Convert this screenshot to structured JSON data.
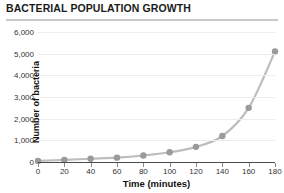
{
  "header": {
    "title": "BACTERIAL POPULATION GROWTH"
  },
  "chart_data": {
    "type": "line",
    "title": "BACTERIAL POPULATION GROWTH",
    "xlabel": "Time (minutes)",
    "ylabel": "Number of bacteria",
    "x": [
      0,
      20,
      40,
      60,
      80,
      100,
      120,
      140,
      160,
      180
    ],
    "values": [
      50,
      100,
      150,
      200,
      300,
      450,
      700,
      1200,
      2500,
      5100
    ],
    "xlim": [
      0,
      180
    ],
    "ylim": [
      0,
      6000
    ],
    "xticks": [
      0,
      20,
      40,
      60,
      80,
      100,
      120,
      140,
      160,
      180
    ],
    "xtick_labels": [
      "0",
      "20",
      "40",
      "60",
      "80",
      "100",
      "120",
      "140",
      "160",
      "180"
    ],
    "yticks": [
      0,
      1000,
      2000,
      3000,
      4000,
      5000,
      6000
    ],
    "ytick_labels": [
      "0",
      "1,000",
      "2,000",
      "3,000",
      "4,000",
      "5,000",
      "6,000"
    ],
    "grid": true,
    "legend": false,
    "marker": "circle",
    "series_color": "#9a9a9a",
    "line_color": "#bdbdbd",
    "grid_color": "#ececec",
    "axis_color": "#4a4a4a"
  }
}
